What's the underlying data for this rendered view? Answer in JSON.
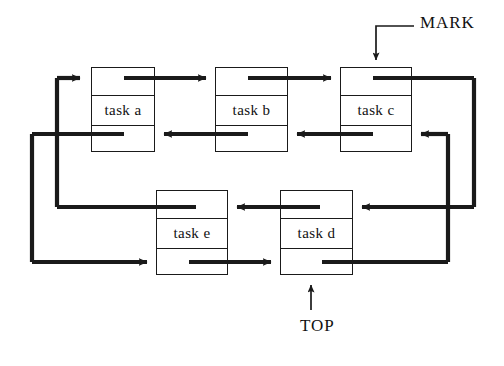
{
  "figure": {
    "type": "diagram",
    "subtype": "doubly-linked-circular-list",
    "background": "#ffffff",
    "ink": "#1a1a1a"
  },
  "nodes": [
    {
      "id": "a",
      "label": "task a",
      "x": 91,
      "y": 67,
      "w": 64,
      "h": 85,
      "row": 1
    },
    {
      "id": "b",
      "label": "task b",
      "x": 215,
      "y": 67,
      "w": 73,
      "h": 85,
      "row": 1
    },
    {
      "id": "c",
      "label": "task c",
      "x": 340,
      "y": 67,
      "w": 72,
      "h": 85,
      "row": 1
    },
    {
      "id": "e",
      "label": "task e",
      "x": 156,
      "y": 190,
      "w": 72,
      "h": 85,
      "row": 2
    },
    {
      "id": "d",
      "label": "task d",
      "x": 280,
      "y": 190,
      "w": 73,
      "h": 85,
      "row": 2
    }
  ],
  "annotations": [
    {
      "id": "mark",
      "text": "MARK",
      "x": 420,
      "y": 13,
      "points_to": "c",
      "direction": "down"
    },
    {
      "id": "top",
      "text": "TOP",
      "x": 300,
      "y": 316,
      "points_to": "d",
      "direction": "up"
    }
  ],
  "links": {
    "forward_label": "forward pointers",
    "backward_label": "backward pointers",
    "forward_order": [
      "a",
      "b",
      "c",
      "d",
      "e",
      "a"
    ],
    "backward_order": [
      "a",
      "e",
      "d",
      "c",
      "b",
      "a"
    ]
  },
  "rails": {
    "left_inner_x": 57,
    "left_outer_x": 32,
    "right_inner_x": 448,
    "right_outer_x": 474,
    "row1_forward_y": 78,
    "row1_backward_y": 134,
    "row2_forward_y": 205,
    "row2_backward_y": 262
  }
}
